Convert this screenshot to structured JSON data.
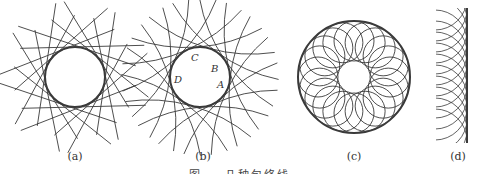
{
  "figure": {
    "panels": [
      {
        "id": "a",
        "label": "(a)",
        "cx": 75,
        "cy": 77,
        "r": 30,
        "type": "tangent-lines",
        "count": 18
      },
      {
        "id": "b",
        "label": "(b)",
        "cx": 200,
        "cy": 77,
        "r": 30,
        "type": "tangent-arcs",
        "count": 18,
        "points": [
          {
            "name": "A",
            "x": 217,
            "y": 79
          },
          {
            "name": "B",
            "x": 211,
            "y": 63
          },
          {
            "name": "C",
            "x": 191,
            "y": 52
          },
          {
            "name": "D",
            "x": 174,
            "y": 74
          }
        ]
      },
      {
        "id": "c",
        "label": "(c)",
        "cx": 354,
        "cy": 77,
        "r": 56,
        "type": "circle-family",
        "count": 20
      },
      {
        "id": "d",
        "label": "(d)",
        "lineX": 467,
        "top": 8,
        "bottom": 143,
        "type": "line-envelope-arcs"
      }
    ],
    "caption": "图 … 几种包络线"
  }
}
